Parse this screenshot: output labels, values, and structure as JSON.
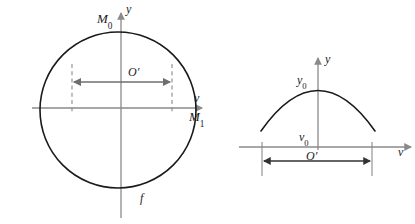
{
  "figure": {
    "background_color": "#ffffff",
    "curve_color": "#1a1a1a",
    "axis_color": "#8a8a8a",
    "dash_color": "#8a8a8a",
    "arrow_color": "#6e6e6e",
    "left_panel": {
      "name": "circle-diagram",
      "shape": "circle",
      "center": [
        118,
        110
      ],
      "radius": 78,
      "labels": {
        "top_point": "M",
        "top_point_sub": "0",
        "y_axis": "y",
        "v_axis": "v",
        "right_point": "M",
        "right_point_sub": "1",
        "span": "O",
        "span_prime": "′",
        "curve": "f"
      },
      "span_arrow": {
        "x1": 72,
        "x2": 172,
        "y": 82
      },
      "dashed_lines": [
        {
          "x": 72,
          "y1": 65,
          "y2": 112
        },
        {
          "x": 172,
          "y1": 65,
          "y2": 112
        }
      ]
    },
    "right_panel": {
      "name": "parabola-diagram",
      "shape": "parabola",
      "apex": [
        318,
        88
      ],
      "labels": {
        "y_axis": "y",
        "v_axis": "v",
        "apex_value": "y",
        "apex_value_sub": "0",
        "origin_value": "v",
        "origin_value_sub": "0",
        "span": "O",
        "span_prime": "′"
      },
      "span_arrow": {
        "x1": 262,
        "x2": 372,
        "y": 161
      },
      "ticks": [
        {
          "x": 262,
          "y1": 147,
          "y2": 176
        },
        {
          "x": 372,
          "y1": 147,
          "y2": 176
        }
      ]
    }
  }
}
